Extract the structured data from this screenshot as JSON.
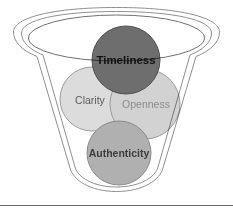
{
  "diagram": {
    "type": "funnel-venn",
    "title": "",
    "background_color": "#ffffff",
    "funnel": {
      "name": "funnel-container",
      "outline_color": "#8f8f8f",
      "rim_color": "#6f6f6f",
      "fill_color": "#ffffff"
    },
    "nodes": [
      {
        "id": "timeliness",
        "label": "Timeliness",
        "fill": "#6e6e6e",
        "stroke": "#4f4f4f",
        "text_color": "#111111",
        "cx": 126,
        "cy": 60,
        "r": 34
      },
      {
        "id": "clarity",
        "label": "Clarity",
        "fill": "#dcdcdc",
        "stroke": "#9a9a9a",
        "text_color": "#5d5d5d",
        "cx": 92,
        "cy": 99,
        "r": 32
      },
      {
        "id": "openness",
        "label": "Openness",
        "fill": "#d2d2d2",
        "stroke": "#9a9a9a",
        "text_color": "#8c8c8c",
        "cx": 145,
        "cy": 104,
        "r": 35
      },
      {
        "id": "authenticity",
        "label": "Authenticity",
        "fill": "#b0b0b0",
        "stroke": "#8a8a8a",
        "text_color": "#3d3d3d",
        "cx": 119,
        "cy": 153,
        "r": 32
      }
    ],
    "divider": {
      "name": "bottom-divider-rule",
      "color": "#6a6a6a",
      "y": 205
    }
  }
}
